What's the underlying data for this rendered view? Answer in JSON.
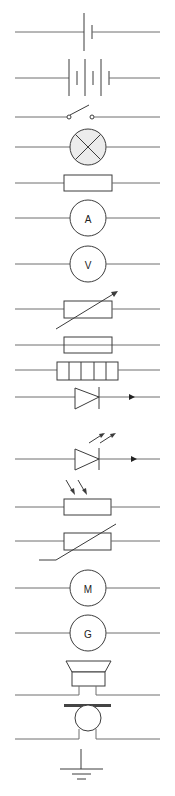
{
  "colors": {
    "background": "#ffffff",
    "wire": "#6e6e6e",
    "symbol": "#3c3c3c",
    "lamp_fill": "#ececec"
  },
  "symbols": [
    {
      "id": "cell",
      "y": 32
    },
    {
      "id": "battery",
      "y": 78
    },
    {
      "id": "switch-open",
      "y": 117
    },
    {
      "id": "lamp",
      "y": 147
    },
    {
      "id": "fixed-resistor",
      "y": 183
    },
    {
      "id": "ammeter",
      "y": 218,
      "label": "A"
    },
    {
      "id": "voltmeter",
      "y": 264,
      "label": "V"
    },
    {
      "id": "variable-resistor",
      "y": 309
    },
    {
      "id": "fuse",
      "y": 345
    },
    {
      "id": "multi-cell-resistor",
      "y": 370
    },
    {
      "id": "diode",
      "y": 397
    },
    {
      "id": "led",
      "y": 459
    },
    {
      "id": "ldr",
      "y": 507
    },
    {
      "id": "thermistor",
      "y": 541
    },
    {
      "id": "motor",
      "y": 588,
      "label": "M"
    },
    {
      "id": "generator",
      "y": 633,
      "label": "G"
    },
    {
      "id": "loudspeaker",
      "y": 694
    },
    {
      "id": "microphone",
      "y": 738
    },
    {
      "id": "earth",
      "y": 770
    }
  ]
}
